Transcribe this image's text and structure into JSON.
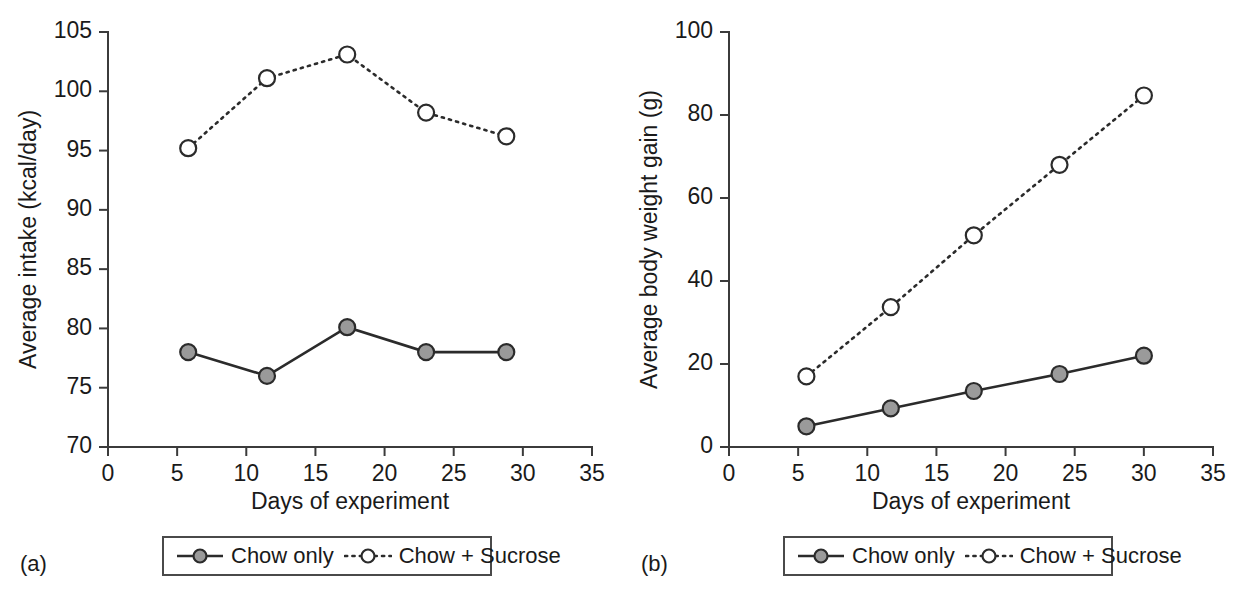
{
  "figure": {
    "panel_a_label": "(a)",
    "panel_b_label": "(b)",
    "legend_entries": [
      {
        "key": "chow_only",
        "label": "Chow only",
        "style": "solid",
        "marker": "filled-circle",
        "color": "#9a9a9a"
      },
      {
        "key": "chow_sucrose",
        "label": "Chow + Sucrose",
        "style": "dotted",
        "marker": "open-circle",
        "color": "#ffffff"
      }
    ]
  },
  "chart_data": [
    {
      "panel": "(a)",
      "type": "line",
      "title": "",
      "xlabel": "Days of experiment",
      "ylabel": "Average intake (kcal/day)",
      "xlim": [
        0,
        35
      ],
      "ylim": [
        70,
        105
      ],
      "xticks": [
        0,
        5,
        10,
        15,
        20,
        25,
        30,
        35
      ],
      "yticks": [
        70,
        75,
        80,
        85,
        90,
        95,
        100,
        105
      ],
      "grid": false,
      "legend_position": "below",
      "series": [
        {
          "name": "Chow only",
          "style": "solid",
          "marker": "filled-circle",
          "x": [
            5.8,
            11.5,
            17.3,
            23.0,
            28.8
          ],
          "values": [
            78.0,
            76.0,
            80.1,
            78.0,
            78.0
          ]
        },
        {
          "name": "Chow + Sucrose",
          "style": "dotted",
          "marker": "open-circle",
          "x": [
            5.8,
            11.5,
            17.3,
            23.0,
            28.8
          ],
          "values": [
            95.2,
            101.1,
            103.1,
            98.2,
            96.2
          ]
        }
      ]
    },
    {
      "panel": "(b)",
      "type": "line",
      "title": "",
      "xlabel": "Days of experiment",
      "ylabel": "Average body weight gain (g)",
      "xlim": [
        0,
        35
      ],
      "ylim": [
        0,
        100
      ],
      "xticks": [
        0,
        5,
        10,
        15,
        20,
        25,
        30,
        35
      ],
      "yticks": [
        0,
        20,
        40,
        60,
        80,
        100
      ],
      "grid": false,
      "legend_position": "below",
      "series": [
        {
          "name": "Chow only",
          "style": "solid",
          "marker": "filled-circle",
          "x": [
            5.6,
            11.7,
            17.7,
            23.9,
            30.0
          ],
          "values": [
            5.0,
            9.3,
            13.5,
            17.6,
            22.0
          ]
        },
        {
          "name": "Chow + Sucrose",
          "style": "dotted",
          "marker": "open-circle",
          "x": [
            5.6,
            11.7,
            17.7,
            23.9,
            30.0
          ],
          "values": [
            17.0,
            33.7,
            51.0,
            68.0,
            84.7
          ]
        }
      ]
    }
  ]
}
